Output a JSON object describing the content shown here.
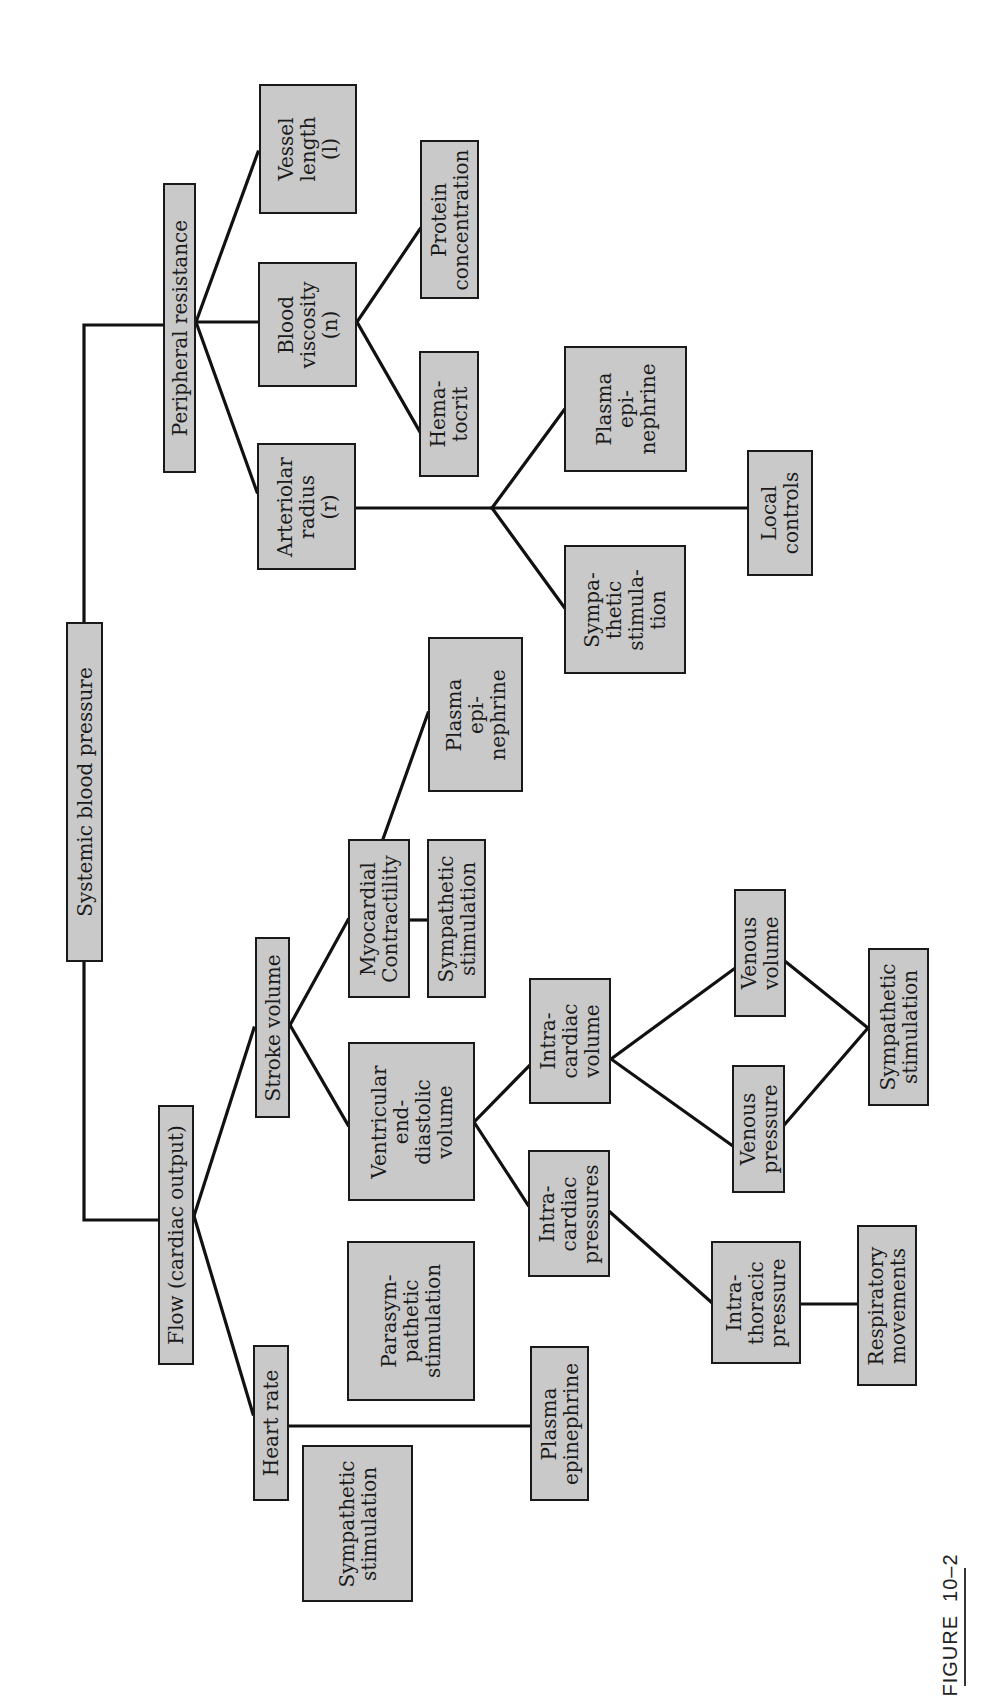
{
  "figure": {
    "caption": "FIGURE  10–2",
    "orientation": "rotated 90° counter-clockwise"
  },
  "colors": {
    "box_fill": "#c9c9c9",
    "box_border": "#1a1a1a",
    "line": "#111111",
    "background": "#ffffff"
  },
  "nodes": {
    "systemic_bp": "Systemic blood pressure",
    "peripheral_resistance": "Peripheral resistance",
    "flow": "Flow (cardiac output)",
    "vessel_length": "Vessel\nlength\n(l)",
    "blood_viscosity": "Blood\nviscosity\n(n)",
    "arteriolar_radius": "Arteriolar\nradius\n(r)",
    "protein_concentration": "Protein\nconcentration",
    "hematocrit": "Hema-\ntocrit",
    "plasma_epi_arteriolar": "Plasma\nepi-\nnephrine",
    "local_controls": "Local\ncontrols",
    "sympathetic_arteriolar": "Sympa-\nthetic\nstimula-\ntion",
    "plasma_epi_myocardial": "Plasma\nepi-\nnephrine",
    "myocardial_contractility": "Myocardial\nContractility",
    "sympathetic_myocardial": "Sympathetic\nstimulation",
    "stroke_volume": "Stroke volume",
    "vedv": "Ventricular\nend-\ndiastolic\nvolume",
    "intracardiac_volume": "Intra-\ncardiac\nvolume",
    "intracardiac_pressures": "Intra-\ncardiac\npressures",
    "venous_volume": "Venous\nvolume",
    "venous_pressure": "Venous\npressure",
    "sympathetic_venous": "Sympathetic\nstimulation",
    "parasympathetic": "Parasym-\npathetic\nstimulation",
    "heart_rate": "Heart rate",
    "intrathoracic_pressure": "Intra-\nthoracic\npressure",
    "respiratory_movements": "Respiratory\nmovements",
    "sympathetic_hr": "Sympathetic\nstimulation",
    "plasma_epi_hr": "Plasma\nepinephrine"
  },
  "edges": [
    [
      "systemic_bp",
      "peripheral_resistance"
    ],
    [
      "systemic_bp",
      "flow"
    ],
    [
      "peripheral_resistance",
      "vessel_length"
    ],
    [
      "peripheral_resistance",
      "blood_viscosity"
    ],
    [
      "peripheral_resistance",
      "arteriolar_radius"
    ],
    [
      "blood_viscosity",
      "protein_concentration"
    ],
    [
      "blood_viscosity",
      "hematocrit"
    ],
    [
      "arteriolar_radius",
      "plasma_epi_arteriolar"
    ],
    [
      "arteriolar_radius",
      "local_controls"
    ],
    [
      "arteriolar_radius",
      "sympathetic_arteriolar"
    ],
    [
      "flow",
      "stroke_volume"
    ],
    [
      "flow",
      "heart_rate"
    ],
    [
      "stroke_volume",
      "myocardial_contractility"
    ],
    [
      "stroke_volume",
      "vedv"
    ],
    [
      "myocardial_contractility",
      "plasma_epi_myocardial"
    ],
    [
      "myocardial_contractility",
      "sympathetic_myocardial"
    ],
    [
      "vedv",
      "intracardiac_volume"
    ],
    [
      "vedv",
      "intracardiac_pressures"
    ],
    [
      "intracardiac_volume",
      "venous_volume"
    ],
    [
      "intracardiac_volume",
      "venous_pressure"
    ],
    [
      "venous_volume",
      "sympathetic_venous"
    ],
    [
      "venous_pressure",
      "sympathetic_venous"
    ],
    [
      "intracardiac_pressures",
      "intrathoracic_pressure"
    ],
    [
      "intrathoracic_pressure",
      "respiratory_movements"
    ],
    [
      "heart_rate",
      "plasma_epi_hr"
    ]
  ]
}
